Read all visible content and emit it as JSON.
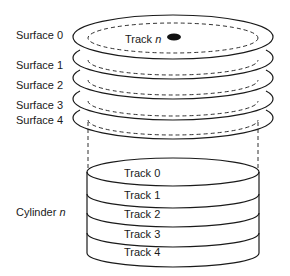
{
  "diagram": {
    "surfaces": [
      {
        "label": "Surface 0"
      },
      {
        "label": "Surface 1"
      },
      {
        "label": "Surface 2"
      },
      {
        "label": "Surface 3"
      },
      {
        "label": "Surface 4"
      }
    ],
    "track_label": {
      "text": "Track",
      "var": "n"
    },
    "cylinder_label": {
      "text": "Cylinder",
      "var": "n"
    },
    "cylinder_tracks": [
      {
        "label": "Track 0"
      },
      {
        "label": "Track 1"
      },
      {
        "label": "Track 2"
      },
      {
        "label": "Track 3"
      },
      {
        "label": "Track 4"
      }
    ],
    "colors": {
      "line": "#1a1a1a",
      "background": "#ffffff"
    }
  }
}
